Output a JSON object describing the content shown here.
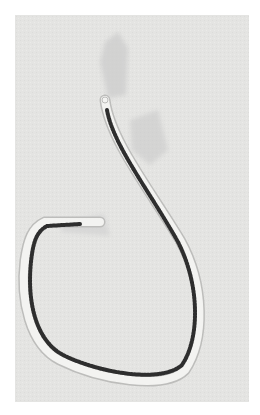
{
  "figure": {
    "colors": {
      "background": "#e4e4e2",
      "body_outline": "#f4f4f2",
      "granules": "#2e2e2e",
      "sheath": "#cfcfcf"
    }
  },
  "caption": {
    "text": ""
  }
}
